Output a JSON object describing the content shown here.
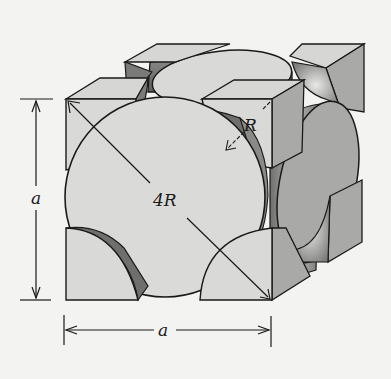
{
  "diagram": {
    "labels": {
      "vertical_edge": "a",
      "horizontal_edge": "a",
      "face_diagonal": "4R",
      "atom_radius": "R"
    },
    "colors": {
      "background": "#f3f3f1",
      "atom_face_light": "#d9d9d7",
      "atom_shade_mid": "#a9a9a7",
      "atom_shade_dark": "#6f6f6d",
      "outline": "#1a1a1a"
    }
  }
}
